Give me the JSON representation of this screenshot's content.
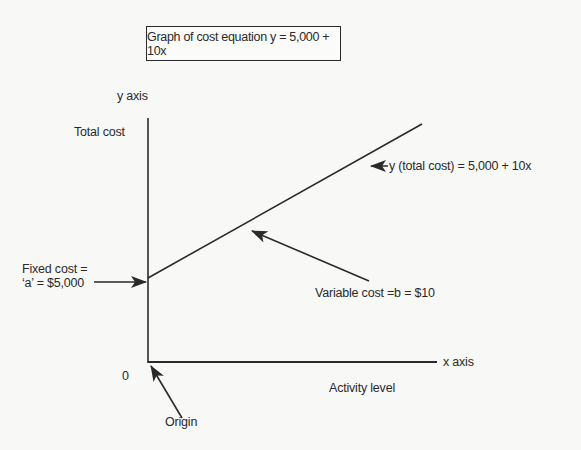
{
  "diagram": {
    "title": "Graph of cost equation y = 5,000 + 10x",
    "y_axis_label": "y axis",
    "y_axis_title": "Total cost",
    "x_axis_label": "x axis",
    "x_axis_title": "Activity level",
    "origin_zero": "0",
    "origin_label": "Origin",
    "fixed_cost_line1": "Fixed cost =",
    "fixed_cost_line2": "‘a’ = $5,000",
    "variable_cost_label": "Variable cost =b = $10",
    "total_cost_label": "y (total cost) = 5,000 + 10x",
    "colors": {
      "background": "#f8f8f7",
      "ink": "#2a2a2a"
    }
  }
}
